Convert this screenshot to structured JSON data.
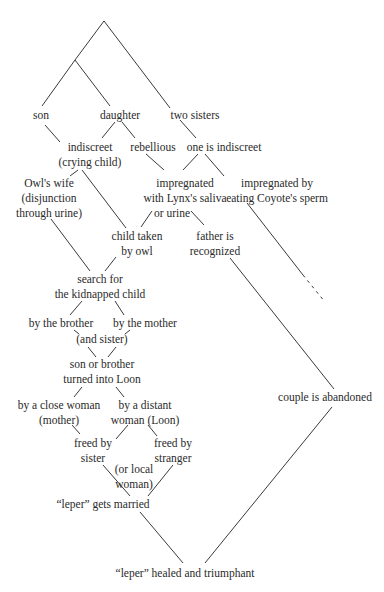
{
  "diagram": {
    "nodes": {
      "son": "son",
      "daughter": "daughter",
      "two_sisters": "two sisters",
      "indiscreet_1": "indiscreet",
      "indiscreet_2": "(crying child)",
      "rebellious": "rebellious",
      "one_indiscreet": "one is indiscreet",
      "owls_wife_1": "Owl's wife",
      "owls_wife_2": "(disjunction",
      "owls_wife_3": "through urine)",
      "lynx_1": "impregnated",
      "lynx_2": "with Lynx's saliva",
      "lynx_3": "or urine",
      "coyote_1": "impregnated by",
      "coyote_2": "eating Coyote's sperm",
      "child_taken_1": "child taken",
      "child_taken_2": "by owl",
      "father_1": "father is",
      "father_2": "recognized",
      "search_1": "search for",
      "search_2": "the kidnapped child",
      "by_brother": "by the brother",
      "by_mother": "by the mother",
      "and_sister": "(and sister)",
      "loon_1": "son or brother",
      "loon_2": "turned into Loon",
      "close_woman_1": "by a close woman",
      "close_woman_2": "(mother)",
      "distant_woman_1": "by a distant",
      "distant_woman_2": "woman (Loon)",
      "freed_sister_1": "freed by",
      "freed_sister_2": "sister",
      "freed_stranger_1": "freed by",
      "freed_stranger_2": "stranger",
      "local_woman_1": "(or local",
      "local_woman_2": "woman)",
      "married": "“leper” gets married",
      "abandoned": "couple is abandoned",
      "healed": "“leper” healed and triumphant"
    },
    "line_color": "#3a3a3a",
    "text_color": "#2a2a2a"
  }
}
